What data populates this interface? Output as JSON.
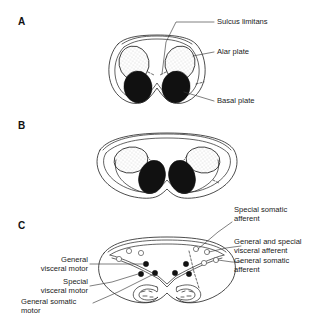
{
  "figure": {
    "background_color": "#ffffff",
    "ink_color": "#1a1a1a",
    "basal_fill_color": "#111111",
    "alar_fill_color": "#ffffff"
  },
  "panels": [
    {
      "letter": "A",
      "name": "panel-a",
      "description": "Early neural tube cross-section with paired alar plates above and basal plates below"
    },
    {
      "letter": "B",
      "name": "panel-b",
      "description": "Neural tube opening out to form rhomboid fossa, alar plates displaced laterally"
    },
    {
      "letter": "C",
      "name": "panel-c",
      "description": "Mature medulla cross-section showing cranial nerve nuclei columns"
    }
  ],
  "labels": {
    "panel_a": [
      {
        "id": "sulcus-limitans",
        "text": "Sulcus limitans"
      },
      {
        "id": "alar-plate",
        "text": "Alar plate"
      },
      {
        "id": "basal-plate",
        "text": "Basal plate"
      }
    ],
    "panel_c_left": [
      {
        "id": "general-visceral-motor",
        "text": "General\nvisceral motor"
      },
      {
        "id": "special-visceral-motor",
        "text": "Special\nvisceral motor"
      },
      {
        "id": "general-somatic-motor",
        "text": "General somatic\nmotor"
      }
    ],
    "panel_c_right": [
      {
        "id": "special-somatic-afferent",
        "text": "Special somatic\nafferent"
      },
      {
        "id": "general-and-special-visceral-afferent",
        "text": "General and special\nvisceral afferent"
      },
      {
        "id": "general-somatic-afferent",
        "text": "General somatic\nafferent"
      }
    ]
  },
  "nuclei": {
    "motor_dots_count": 6,
    "sensory_circles_count": 7,
    "olives_count": 2
  }
}
